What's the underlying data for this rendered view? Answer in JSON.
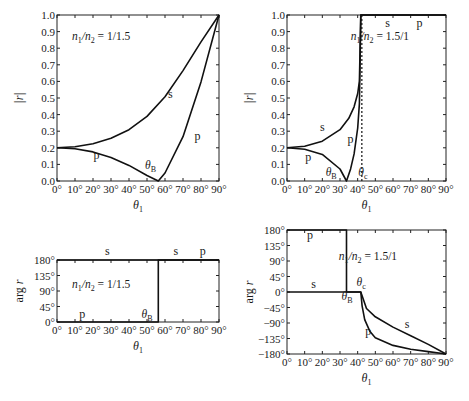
{
  "chart_data": [
    {
      "id": "top-left",
      "type": "line",
      "title": "",
      "annotation": "n1/n2 = 1/1.5",
      "xlabel": "θ1",
      "ylabel": "|r|",
      "xlim": [
        0,
        90
      ],
      "ylim": [
        0,
        1
      ],
      "xticks": [
        "0°",
        "10°",
        "20°",
        "30°",
        "40°",
        "50°",
        "60°",
        "70°",
        "80°",
        "90°"
      ],
      "yticks": [
        "0.0",
        "0.1",
        "0.2",
        "0.3",
        "0.4",
        "0.5",
        "0.6",
        "0.7",
        "0.8",
        "0.9",
        "1.0"
      ],
      "grid": false,
      "series": [
        {
          "name": "s",
          "x": [
            0,
            10,
            20,
            30,
            40,
            50,
            60,
            70,
            80,
            90
          ],
          "y": [
            0.2,
            0.206,
            0.224,
            0.257,
            0.309,
            0.389,
            0.507,
            0.665,
            0.838,
            1.0
          ]
        },
        {
          "name": "p",
          "x": [
            0,
            10,
            20,
            30,
            40,
            50,
            56.3,
            60,
            70,
            80,
            90
          ],
          "y": [
            0.2,
            0.194,
            0.175,
            0.142,
            0.094,
            0.033,
            0.0,
            0.048,
            0.267,
            0.597,
            1.0
          ]
        }
      ],
      "labels": [
        {
          "text": "s",
          "x": 63,
          "y": 0.5
        },
        {
          "text": "p",
          "x": 22,
          "y": 0.13
        },
        {
          "text": "p",
          "x": 78,
          "y": 0.25
        },
        {
          "text": "θB",
          "x": 52,
          "y": 0.07
        }
      ],
      "brewster_angle": 56.3
    },
    {
      "id": "top-right",
      "type": "line",
      "title": "",
      "annotation": "n1/n2 = 1.5/1",
      "xlabel": "θ1",
      "ylabel": "|r|",
      "xlim": [
        0,
        90
      ],
      "ylim": [
        0,
        1
      ],
      "xticks": [
        "0°",
        "10°",
        "20°",
        "30°",
        "40°",
        "50°",
        "60°",
        "70°",
        "80°",
        "90°"
      ],
      "yticks": [
        "0.0",
        "0.1",
        "0.2",
        "0.3",
        "0.4",
        "0.5",
        "0.6",
        "0.7",
        "0.8",
        "0.9",
        "1.0"
      ],
      "grid": false,
      "series": [
        {
          "name": "s",
          "x": [
            0,
            10,
            20,
            30,
            35,
            38,
            40,
            41,
            41.8,
            90
          ],
          "y": [
            0.2,
            0.209,
            0.24,
            0.309,
            0.378,
            0.447,
            0.527,
            0.602,
            1.0,
            1.0
          ]
        },
        {
          "name": "p",
          "x": [
            0,
            10,
            20,
            30,
            33.7,
            36,
            38,
            40,
            41,
            41.8,
            90
          ],
          "y": [
            0.2,
            0.191,
            0.16,
            0.072,
            0.0,
            0.073,
            0.163,
            0.319,
            0.466,
            1.0,
            1.0
          ]
        }
      ],
      "labels": [
        {
          "text": "s",
          "x": 20,
          "y": 0.3
        },
        {
          "text": "p",
          "x": 12,
          "y": 0.12
        },
        {
          "text": "p",
          "x": 36,
          "y": 0.23
        },
        {
          "text": "s",
          "x": 57,
          "y": 0.93
        },
        {
          "text": "p",
          "x": 75,
          "y": 0.93
        },
        {
          "text": "θB",
          "x": 25,
          "y": 0.03
        },
        {
          "text": "θc",
          "x": 43,
          "y": 0.03
        }
      ],
      "brewster_angle": 33.7,
      "critical_angle": 41.8
    },
    {
      "id": "bottom-left",
      "type": "line",
      "title": "",
      "annotation": "n1/n2 = 1/1.5",
      "xlabel": "θ1",
      "ylabel": "arg r",
      "xlim": [
        0,
        90
      ],
      "ylim": [
        0,
        180
      ],
      "xticks": [
        "0°",
        "10°",
        "20°",
        "30°",
        "40°",
        "50°",
        "60°",
        "70°",
        "80°",
        "90°"
      ],
      "yticks": [
        "0°",
        "45°",
        "90°",
        "135°",
        "180°"
      ],
      "grid": false,
      "series": [
        {
          "name": "s",
          "x": [
            0,
            90
          ],
          "y": [
            180,
            180
          ]
        },
        {
          "name": "p",
          "x": [
            0,
            56.3,
            56.3,
            90
          ],
          "y": [
            0,
            0,
            180,
            180
          ]
        }
      ],
      "labels": [
        {
          "text": "s",
          "x": 28,
          "y": 195
        },
        {
          "text": "s",
          "x": 66,
          "y": 195
        },
        {
          "text": "p",
          "x": 81,
          "y": 195
        },
        {
          "text": "p",
          "x": 14,
          "y": 12
        },
        {
          "text": "θB",
          "x": 50,
          "y": 12
        }
      ],
      "brewster_angle": 56.3
    },
    {
      "id": "bottom-right",
      "type": "line",
      "title": "",
      "annotation": "n1/n2 = 1.5/1",
      "xlabel": "θ1",
      "ylabel": "arg r",
      "xlim": [
        0,
        90
      ],
      "ylim": [
        -180,
        180
      ],
      "xticks": [
        "0°",
        "10°",
        "20°",
        "30°",
        "40°",
        "50°",
        "60°",
        "70°",
        "80°",
        "90°"
      ],
      "yticks": [
        "−180°",
        "−135°",
        "−90°",
        "−45°",
        "0°",
        "45°",
        "90°",
        "135°",
        "180°"
      ],
      "grid": false,
      "series": [
        {
          "name": "s",
          "x": [
            0,
            41.8,
            45,
            50,
            60,
            70,
            80,
            90
          ],
          "y": [
            0,
            0,
            -48,
            -72,
            -102,
            -127,
            -152,
            -180
          ]
        },
        {
          "name": "p",
          "x": [
            0,
            33.7,
            33.7,
            41.8,
            42.5,
            44,
            47,
            50,
            60,
            70,
            80,
            90
          ],
          "y": [
            180,
            180,
            0,
            0,
            -40,
            -80,
            -115,
            -133,
            -155,
            -166,
            -173,
            -180
          ]
        }
      ],
      "labels": [
        {
          "text": "p",
          "x": 13,
          "y": 155
        },
        {
          "text": "s",
          "x": 15,
          "y": 12
        },
        {
          "text": "s",
          "x": 68,
          "y": -105
        },
        {
          "text": "p",
          "x": 46,
          "y": -125
        },
        {
          "text": "θB",
          "x": 34,
          "y": -22
        },
        {
          "text": "θc",
          "x": 42,
          "y": 16
        }
      ],
      "brewster_angle": 33.7,
      "critical_angle": 41.8
    }
  ],
  "panels": {
    "tl": {
      "ann": "1/1.5",
      "ylabel": "|r|",
      "xlabel": "1"
    },
    "tr": {
      "ann": "1.5/1",
      "ylabel": "|r|",
      "xlabel": "1"
    },
    "bl": {
      "ann": "1/1.5",
      "ylabel": "arg r",
      "xlabel": "1"
    },
    "br": {
      "ann": "1.5/1",
      "ylabel": "arg r",
      "xlabel": "1"
    }
  }
}
